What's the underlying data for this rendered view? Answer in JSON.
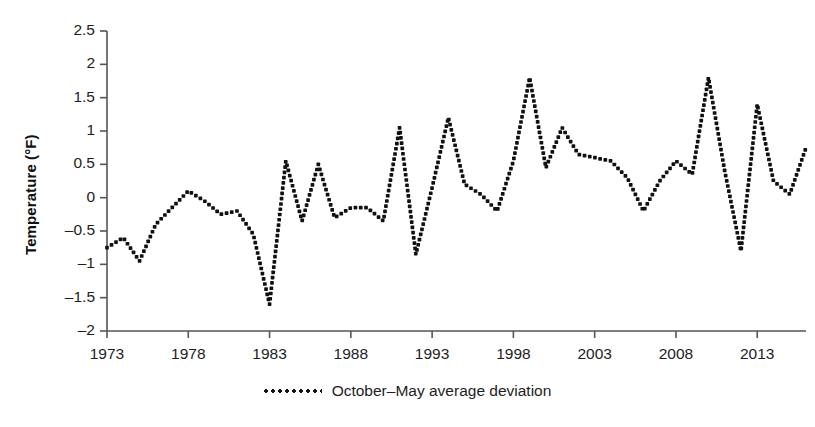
{
  "chart_data": {
    "type": "line",
    "title": "",
    "xlabel": "",
    "ylabel": "Temperature (°F)",
    "grid": false,
    "legend_position": "bottom-center",
    "marker": "dotted",
    "xlim": [
      1973,
      2016
    ],
    "ylim": [
      -2,
      2.5
    ],
    "y_ticks": [
      2.5,
      2,
      1.5,
      1,
      0.5,
      0,
      -0.5,
      -1,
      -1.5,
      -2
    ],
    "y_tick_labels": [
      "2.5",
      "2",
      "1.5",
      "1",
      "0.5",
      "0",
      "–0.5",
      "–1",
      "–1.5",
      "–2"
    ],
    "x_ticks": [
      1973,
      1978,
      1983,
      1988,
      1993,
      1998,
      2003,
      2008,
      2013
    ],
    "x_tick_labels": [
      "1973",
      "1978",
      "1983",
      "1988",
      "1993",
      "1998",
      "2003",
      "2008",
      "2013"
    ],
    "series": [
      {
        "name": "October–May average deviation",
        "color": "#111111",
        "x": [
          1973,
          1974,
          1975,
          1976,
          1977,
          1978,
          1979,
          1980,
          1981,
          1982,
          1983,
          1984,
          1985,
          1986,
          1987,
          1988,
          1989,
          1990,
          1991,
          1992,
          1993,
          1994,
          1995,
          1996,
          1997,
          1998,
          1999,
          2000,
          2001,
          2002,
          2003,
          2004,
          2005,
          2006,
          2007,
          2008,
          2009,
          2010,
          2011,
          2012,
          2013,
          2014,
          2015,
          2016
        ],
        "values": [
          -0.75,
          -0.6,
          -0.95,
          -0.4,
          -0.15,
          0.1,
          -0.05,
          -0.25,
          -0.2,
          -0.55,
          -1.6,
          0.55,
          -0.35,
          0.5,
          -0.3,
          -0.15,
          -0.15,
          -0.35,
          1.05,
          -0.85,
          0.15,
          1.2,
          0.2,
          0.05,
          -0.2,
          0.55,
          1.8,
          0.45,
          1.05,
          0.65,
          0.6,
          0.55,
          0.3,
          -0.2,
          0.25,
          0.55,
          0.35,
          1.8,
          0.4,
          -0.8,
          1.4,
          0.25,
          0.05,
          0.75
        ]
      }
    ]
  },
  "legend": {
    "label": "October–May average deviation",
    "marker_name": "dotted-line-swatch"
  },
  "axes": {
    "y_title": "Temperature (°F)"
  }
}
